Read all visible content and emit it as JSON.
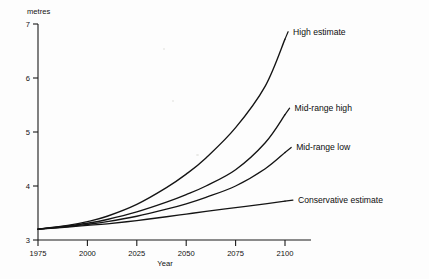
{
  "chart_data": {
    "type": "line",
    "title": "",
    "xlabel": "Year",
    "ylabel": "metres",
    "unit_label": "metres",
    "xlim": [
      1975,
      2100
    ],
    "ylim": [
      3,
      7
    ],
    "grid": false,
    "legend_position": "inline-right-of-curve-end",
    "xticks": [
      1975,
      2000,
      2025,
      2050,
      2075,
      2100
    ],
    "xtick_labels": [
      "1975",
      "2000",
      "2025",
      "2050",
      "2075",
      "2100"
    ],
    "yticks": [
      3,
      4,
      5,
      6,
      7
    ],
    "ytick_labels": [
      "3",
      "4",
      "5",
      "6",
      "7"
    ],
    "x": [
      1975,
      1990,
      2000,
      2010,
      2025,
      2040,
      2050,
      2060,
      2075,
      2090,
      2100
    ],
    "series": [
      {
        "name": "High estimate",
        "label": "High estimate",
        "color": "#141414",
        "values": [
          3.2,
          3.27,
          3.34,
          3.44,
          3.66,
          3.97,
          4.22,
          4.52,
          5.08,
          5.85,
          6.72
        ]
      },
      {
        "name": "Mid-range high",
        "label": "Mid-range high",
        "color": "#141414",
        "values": [
          3.2,
          3.26,
          3.31,
          3.38,
          3.52,
          3.7,
          3.84,
          4.0,
          4.3,
          4.8,
          5.32
        ]
      },
      {
        "name": "Mid-range low",
        "label": "Mid-range low",
        "color": "#141414",
        "values": [
          3.2,
          3.25,
          3.29,
          3.34,
          3.44,
          3.57,
          3.67,
          3.79,
          4.0,
          4.32,
          4.62
        ]
      },
      {
        "name": "Conservative estimate",
        "label": "Conservative estimate",
        "color": "#141414",
        "values": [
          3.2,
          3.24,
          3.27,
          3.3,
          3.36,
          3.43,
          3.48,
          3.53,
          3.6,
          3.67,
          3.72
        ]
      }
    ],
    "annotations": [
      {
        "text": "High estimate",
        "at_x": 2100,
        "at_y": 6.72
      },
      {
        "text": "Mid-range high",
        "at_x": 2100,
        "at_y": 5.32
      },
      {
        "text": "Mid-range low",
        "at_x": 2100,
        "at_y": 4.62
      },
      {
        "text": "Conservative estimate",
        "at_x": 2100,
        "at_y": 3.72
      }
    ]
  }
}
